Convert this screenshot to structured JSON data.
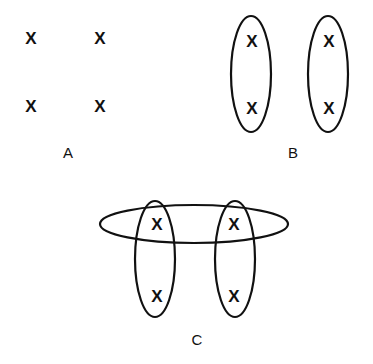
{
  "panels": {
    "A": {
      "label": "A",
      "marks": [
        "X",
        "X",
        "X",
        "X"
      ]
    },
    "B": {
      "label": "B",
      "marks": [
        "X",
        "X",
        "X",
        "X"
      ],
      "groupings": [
        "vertical-pair-left",
        "vertical-pair-right"
      ]
    },
    "C": {
      "label": "C",
      "marks": [
        "X",
        "X",
        "X",
        "X"
      ],
      "groupings": [
        "horizontal-top-pair",
        "vertical-pair-left",
        "vertical-pair-right"
      ]
    }
  }
}
